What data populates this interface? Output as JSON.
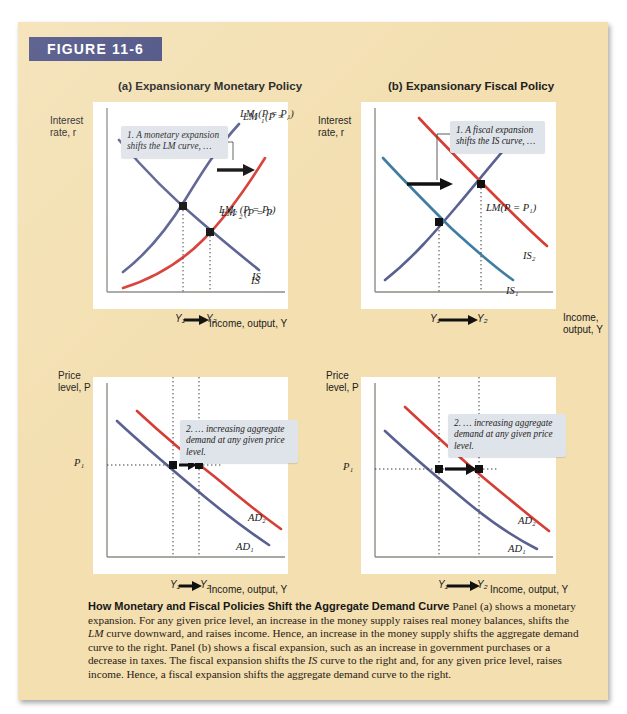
{
  "figure": {
    "banner_label": "FIGURE 11-6"
  },
  "panels": {
    "a": {
      "title": "(a) Expansionary Monetary Policy",
      "y_axis_label_line1": "Interest",
      "y_axis_label_line2": "rate, r",
      "x_axis_label": "Income, output, Y",
      "callout": "1. A monetary expansion shifts the LM curve, …",
      "curve_labels": {
        "lm1": "LM₁(P = P₁)",
        "lm2": "LM₂ (P = P₁)",
        "is": "IS"
      },
      "ticks": [
        "Y₁",
        "Y₂"
      ]
    },
    "b": {
      "title": "(b) Expansionary Fiscal Policy",
      "y_axis_label_line1": "Interest",
      "y_axis_label_line2": "rate, r",
      "x_axis_label_line1": "Income,",
      "x_axis_label_line2": "output, Y",
      "callout": "1. A fiscal expansion shifts the IS curve, …",
      "curve_labels": {
        "lm": "LM(P = P₁)",
        "is1": "IS₁",
        "is2": "IS₂"
      },
      "ticks": [
        "Y₁",
        "Y₂"
      ]
    },
    "c": {
      "y_axis_label_line1": "Price",
      "y_axis_label_line2": "level, P",
      "x_axis_label": "Income, output, Y",
      "callout": "2. … increasing aggregate demand at any given price level.",
      "curve_labels": {
        "ad1": "AD₁",
        "ad2": "AD₂"
      },
      "y_tick": "P₁",
      "ticks": [
        "Y₁",
        "Y₂"
      ]
    },
    "d": {
      "y_axis_label_line1": "Price",
      "y_axis_label_line2": "level, P",
      "x_axis_label": "Income, output, Y",
      "callout": "2. … increasing aggregate demand at any given price level.",
      "curve_labels": {
        "ad1": "AD₁",
        "ad2": "AD₂"
      },
      "y_tick": "P₁",
      "ticks": [
        "Y₁",
        "Y₂"
      ]
    }
  },
  "caption": {
    "title": "How Monetary and Fiscal Policies Shift the Aggregate Demand Curve",
    "body": "Panel (a) shows a monetary expansion. For any given price level, an increase in the money supply raises real money balances, shifts the LM curve downward, and raises income. Hence, an increase in the money supply shifts the aggregate demand curve to the right. Panel (b) shows a fiscal expansion, such as an increase in government purchases or a decrease in taxes. The fiscal expansion shifts the IS curve to the right and, for any given price level, raises income. Hence, a fiscal expansion shifts the aggregate demand curve to the right."
  },
  "colors": {
    "background": "#f3dfb0",
    "banner": "#44497e",
    "curve_blue": "#5a6090",
    "curve_red": "#d63d34",
    "curve_teal": "#3f7da0",
    "callout_bg": "#dfe3ea",
    "panel_bg": "#ffffff"
  },
  "chart_data": [
    {
      "type": "line",
      "id": "panel-a",
      "title": "(a) Expansionary Monetary Policy",
      "xlabel": "Income, output, Y",
      "ylabel": "Interest rate, r",
      "grid": false,
      "legend": "inline-curve-labels",
      "series": [
        {
          "name": "LM1(P = P1)",
          "color": "#5a6090",
          "slope": "upward",
          "points": [
            [
              0.2,
              0.08
            ],
            [
              0.52,
              0.52
            ],
            [
              0.8,
              0.9
            ]
          ]
        },
        {
          "name": "LM2(P = P1)",
          "color": "#d63d34",
          "slope": "upward",
          "points": [
            [
              0.16,
              -0.05
            ],
            [
              0.64,
              0.38
            ],
            [
              0.92,
              0.72
            ]
          ]
        },
        {
          "name": "IS",
          "color": "#5a6090",
          "slope": "downward",
          "points": [
            [
              0.1,
              0.8
            ],
            [
              0.52,
              0.52
            ],
            [
              0.88,
              0.17
            ]
          ]
        }
      ],
      "equilibria": [
        {
          "label": "Y1",
          "x": 0.52,
          "y": 0.52
        },
        {
          "label": "Y2",
          "x": 0.64,
          "y": 0.38
        }
      ],
      "annotations": [
        "1. A monetary expansion shifts the LM curve, …"
      ]
    },
    {
      "type": "line",
      "id": "panel-b",
      "title": "(b) Expansionary Fiscal Policy",
      "xlabel": "Income, output, Y",
      "ylabel": "Interest rate, r",
      "grid": false,
      "series": [
        {
          "name": "LM(P = P1)",
          "color": "#5a6090",
          "slope": "upward",
          "points": [
            [
              0.13,
              0.08
            ],
            [
              0.4,
              0.4
            ],
            [
              0.78,
              0.82
            ]
          ]
        },
        {
          "name": "IS1",
          "color": "#3f7da0",
          "slope": "downward",
          "points": [
            [
              0.06,
              0.72
            ],
            [
              0.4,
              0.4
            ],
            [
              0.74,
              0.12
            ]
          ]
        },
        {
          "name": "IS2",
          "color": "#d63d34",
          "slope": "downward",
          "points": [
            [
              0.28,
              0.92
            ],
            [
              0.62,
              0.62
            ],
            [
              0.92,
              0.32
            ]
          ]
        }
      ],
      "equilibria": [
        {
          "label": "Y1",
          "x": 0.4,
          "y": 0.4
        },
        {
          "label": "Y2",
          "x": 0.62,
          "y": 0.62
        }
      ],
      "annotations": [
        "1. A fiscal expansion shifts the IS curve, …"
      ]
    },
    {
      "type": "line",
      "id": "panel-c",
      "xlabel": "Income, output, Y",
      "ylabel": "Price level, P",
      "grid": false,
      "series": [
        {
          "name": "AD1",
          "color": "#5a6090",
          "slope": "downward",
          "points": [
            [
              0.1,
              0.78
            ],
            [
              0.44,
              0.54
            ],
            [
              0.92,
              0.14
            ]
          ]
        },
        {
          "name": "AD2",
          "color": "#d63d34",
          "slope": "downward",
          "points": [
            [
              0.22,
              0.84
            ],
            [
              0.62,
              0.54
            ],
            [
              0.97,
              0.2
            ]
          ]
        }
      ],
      "markers": [
        {
          "label": "Y1 at P1",
          "x": 0.44,
          "y": 0.54
        },
        {
          "label": "Y2 at P1",
          "x": 0.62,
          "y": 0.54
        }
      ],
      "reference_lines": [
        {
          "axis": "y",
          "label": "P1",
          "value": 0.54
        }
      ],
      "annotations": [
        "2. … increasing aggregate demand at any given price level."
      ]
    },
    {
      "type": "line",
      "id": "panel-d",
      "xlabel": "Income, output, Y",
      "ylabel": "Price level, P",
      "grid": false,
      "series": [
        {
          "name": "AD1",
          "color": "#5a6090",
          "slope": "downward",
          "points": [
            [
              0.1,
              0.78
            ],
            [
              0.44,
              0.54
            ],
            [
              0.92,
              0.14
            ]
          ]
        },
        {
          "name": "AD2",
          "color": "#d63d34",
          "slope": "downward",
          "points": [
            [
              0.22,
              0.88
            ],
            [
              0.62,
              0.54
            ],
            [
              0.97,
              0.22
            ]
          ]
        }
      ],
      "markers": [
        {
          "label": "Y1 at P1",
          "x": 0.44,
          "y": 0.54
        },
        {
          "label": "Y2 at P1",
          "x": 0.62,
          "y": 0.54
        }
      ],
      "reference_lines": [
        {
          "axis": "y",
          "label": "P1",
          "value": 0.54
        }
      ],
      "annotations": [
        "2. … increasing aggregate demand at any given price level."
      ]
    }
  ]
}
